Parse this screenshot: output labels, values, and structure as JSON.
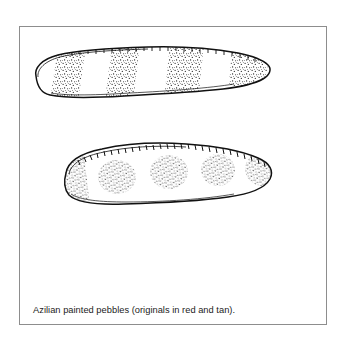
{
  "figure": {
    "caption": "Azilian painted pebbles (originals in red and tan).",
    "frame": {
      "border_color": "#8d8d8d",
      "background_color": "#ffffff"
    },
    "ink_color": "#111111",
    "page_background": "#ffffff",
    "artifacts": [
      {
        "id": "pebble-upper",
        "name": "upper-painted-pebble",
        "shape": "elongated flattened cobble, tapered to a rounded point at the right end, blunt rounded left end",
        "decoration_type": "transverse painted bands",
        "decoration_count": 4,
        "decoration_label": "four stippled vertical bands",
        "stipple_density": "dense",
        "outline_style": "hand-drawn ink contour with hatched shading along upper edge"
      },
      {
        "id": "pebble-lower",
        "name": "lower-painted-pebble",
        "shape": "broad oval cobble with a flattened lower edge and rounded right end",
        "decoration_type": "painted round spots",
        "decoration_count": 4,
        "decoration_label": "four stippled round dots plus stippled left margin",
        "stipple_density": "dense",
        "outline_style": "hand-drawn ink contour with comb-like hatching along upper edge"
      }
    ],
    "pigments": [
      "red",
      "tan"
    ],
    "culture": "Azilian"
  }
}
